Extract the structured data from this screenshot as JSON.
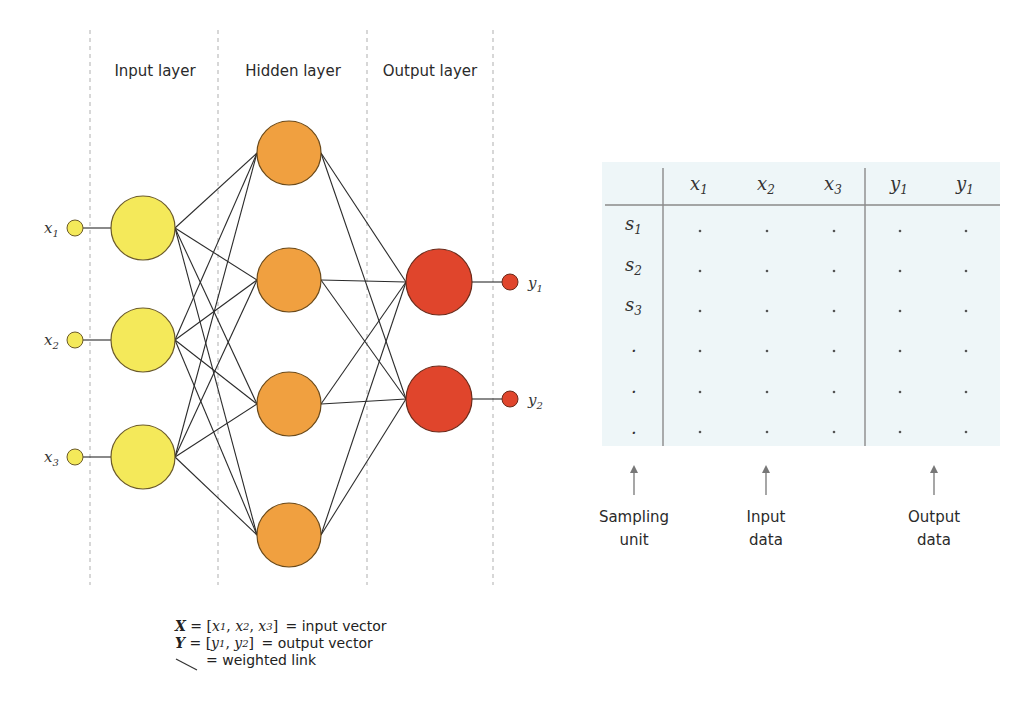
{
  "network": {
    "layer_labels": {
      "input": "Input layer",
      "hidden": "Hidden layer",
      "output": "Output layer"
    },
    "input_nodes": [
      {
        "label": "x",
        "sub": "1"
      },
      {
        "label": "x",
        "sub": "2"
      },
      {
        "label": "x",
        "sub": "3"
      }
    ],
    "output_nodes": [
      {
        "label": "y",
        "sub": "1"
      },
      {
        "label": "y",
        "sub": "2"
      }
    ],
    "hidden_count": 4,
    "colors": {
      "input": "#f4e95a",
      "hidden": "#f0a040",
      "output": "#e0452c",
      "stroke": "#6b5a2a",
      "link": "#2b2b2b",
      "divider": "#bdbdbd"
    }
  },
  "table": {
    "background": "#eef6f8",
    "headers": [
      {
        "label": "x",
        "sub": "1"
      },
      {
        "label": "x",
        "sub": "2"
      },
      {
        "label": "x",
        "sub": "3"
      },
      {
        "label": "y",
        "sub": "1"
      },
      {
        "label": "y",
        "sub": "1"
      }
    ],
    "rows": [
      {
        "label": "s",
        "sub": "1",
        "cells": [
          ".",
          ".",
          ".",
          ".",
          "."
        ]
      },
      {
        "label": "s",
        "sub": "2",
        "cells": [
          ".",
          ".",
          ".",
          ".",
          "."
        ]
      },
      {
        "label": "s",
        "sub": "3",
        "cells": [
          ".",
          ".",
          ".",
          ".",
          "."
        ]
      },
      {
        "label": ".",
        "sub": "",
        "cells": [
          ".",
          ".",
          ".",
          ".",
          "."
        ]
      },
      {
        "label": ".",
        "sub": "",
        "cells": [
          ".",
          ".",
          ".",
          ".",
          "."
        ]
      },
      {
        "label": ".",
        "sub": "",
        "cells": [
          ".",
          ".",
          ".",
          ".",
          "."
        ]
      }
    ],
    "annotations": [
      {
        "line1": "Sampling",
        "line2": "unit"
      },
      {
        "line1": "Input",
        "line2": "data"
      },
      {
        "line1": "Output",
        "line2": "data"
      }
    ]
  },
  "legend": {
    "x_vector_symbol": "X",
    "x_vector_eq": " = [",
    "x_vector_items": [
      "x",
      "x",
      "x"
    ],
    "x_vector_subs": [
      "1",
      "2",
      "3"
    ],
    "x_vector_desc": "= input vector",
    "y_vector_symbol": "Y",
    "y_vector_items": [
      "y",
      "y"
    ],
    "y_vector_subs": [
      "1",
      "2"
    ],
    "y_vector_desc": "= output vector",
    "link_desc": "= weighted link"
  }
}
